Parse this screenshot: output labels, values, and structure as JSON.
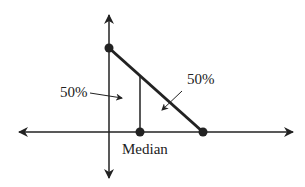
{
  "diagram": {
    "type": "median-of-triangular-distribution",
    "labels": {
      "left_area": "50%",
      "right_area": "50%",
      "median": "Median"
    },
    "colors": {
      "ink": "#222222",
      "background": "#ffffff"
    },
    "points": [
      {
        "name": "top-vertex",
        "x": 109,
        "y": 48
      },
      {
        "name": "median-point",
        "x": 140,
        "y": 132
      },
      {
        "name": "right-vertex",
        "x": 203,
        "y": 132
      }
    ]
  }
}
